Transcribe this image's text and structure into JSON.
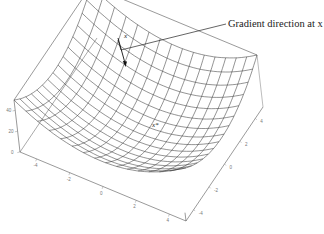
{
  "figure": {
    "type": "3d-surface-mesh",
    "function": "f(x1,x2) = x1^2 + x2^2",
    "domain": [
      -5,
      5
    ],
    "grid_lines": 15,
    "colors": {
      "mesh": "#3a3a3a",
      "box": "#555555",
      "background": "#ffffff",
      "arrow": "#111111"
    }
  },
  "annotation": {
    "label": "Gradient direction at x",
    "point_label": "x",
    "minimum_label": "x*"
  },
  "axes": {
    "front_axis_ticks": [
      "-4",
      "-2",
      "0",
      "2",
      "4"
    ],
    "side_axis_ticks": [
      "-4",
      "-2",
      "0",
      "2",
      "4"
    ],
    "z_axis_ticks": [
      "0",
      "20",
      "40"
    ]
  }
}
